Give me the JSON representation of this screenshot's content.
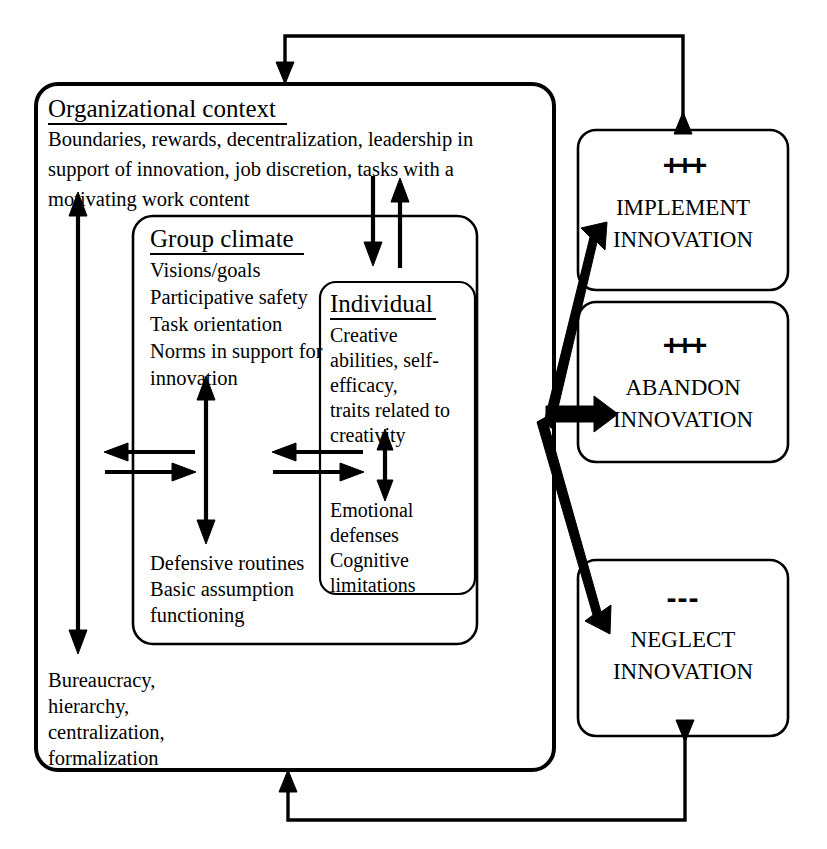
{
  "diagram": {
    "colors": {
      "ink": "#000000",
      "background": "#ffffff"
    },
    "organizational_context": {
      "heading": "Organizational context",
      "description_lines": [
        "Boundaries, rewards, decentralization, leadership in",
        "support of innovation, job discretion, tasks with a",
        "motivating work content"
      ],
      "negative_lines": [
        "Bureaucracy,",
        "hierarchy,",
        "centralization,",
        "formalization"
      ]
    },
    "group_climate": {
      "heading": "Group climate",
      "positive_lines": [
        "Visions/goals",
        "Participative safety",
        "Task orientation",
        "Norms in support for",
        "innovation"
      ],
      "negative_lines": [
        "Defensive routines",
        "Basic assumption",
        "functioning"
      ]
    },
    "individual": {
      "heading": "Individual",
      "positive_lines": [
        "Creative",
        "abilities, self-",
        "efficacy,",
        "traits related to",
        "creativity"
      ],
      "negative_lines": [
        "Emotional",
        "defenses",
        "Cognitive",
        "limitations"
      ]
    },
    "outcomes": [
      {
        "sign": "+++",
        "sign_type": "plus",
        "line1": "IMPLEMENT",
        "line2": "INNOVATION"
      },
      {
        "sign": "+++",
        "sign_type": "plus",
        "line1": "ABANDON",
        "line2": "INNOVATION"
      },
      {
        "sign": "---",
        "sign_type": "minus",
        "line1": "NEGLECT",
        "line2": "INNOVATION"
      }
    ],
    "connectors": {
      "top_feedback": "feedback from implement innovation to organizational context",
      "bottom_feedback": "feedback from neglect innovation to organizational context",
      "context_group_exchange": "bidirectional exchange between organizational context and group climate",
      "group_individual_exchange": "bidirectional exchange between group climate and individual",
      "outcome_fan": "three outcome arrows"
    }
  }
}
